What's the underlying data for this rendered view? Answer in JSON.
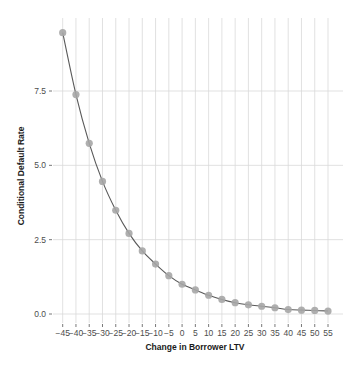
{
  "chart_data": {
    "type": "line",
    "title": "",
    "xlabel": "Change in Borrower LTV",
    "ylabel": "Conditional Default Rate",
    "x": [
      -45,
      -40,
      -35,
      -30,
      -25,
      -20,
      -15,
      -10,
      -5,
      0,
      5,
      10,
      15,
      20,
      25,
      30,
      35,
      40,
      45,
      50,
      55
    ],
    "series": [
      {
        "name": "Conditional Default Rate",
        "values": [
          9.46,
          7.38,
          5.74,
          4.46,
          3.49,
          2.71,
          2.12,
          1.68,
          1.29,
          1.0,
          0.81,
          0.63,
          0.49,
          0.38,
          0.31,
          0.26,
          0.21,
          0.15,
          0.13,
          0.12,
          0.1
        ],
        "markers": true,
        "line_color": "#595959",
        "marker_color": "#a6a6a6"
      }
    ],
    "x_ticks": [
      -45,
      -40,
      -35,
      -30,
      -25,
      -20,
      -15,
      -10,
      -5,
      0,
      5,
      10,
      15,
      20,
      25,
      30,
      35,
      40,
      45,
      50,
      55
    ],
    "x_tick_labels": [
      "−45",
      "−40",
      "−35",
      "−30",
      "−25",
      "−20",
      "−15",
      "−10",
      "−5",
      "0",
      "5",
      "10",
      "15",
      "20",
      "25",
      "30",
      "35",
      "40",
      "45",
      "50",
      "55"
    ],
    "y_ticks": [
      0.0,
      2.5,
      5.0,
      7.5
    ],
    "y_tick_labels": [
      "0.0",
      "2.5",
      "5.0",
      "7.5"
    ],
    "xlim": [
      -47.5,
      60
    ],
    "ylim": [
      -0.3,
      10.2
    ],
    "grid": true,
    "legend": null
  },
  "colors": {
    "grid": "#d9d9d9",
    "tick": "#4d4d4d",
    "background": "#ffffff"
  }
}
